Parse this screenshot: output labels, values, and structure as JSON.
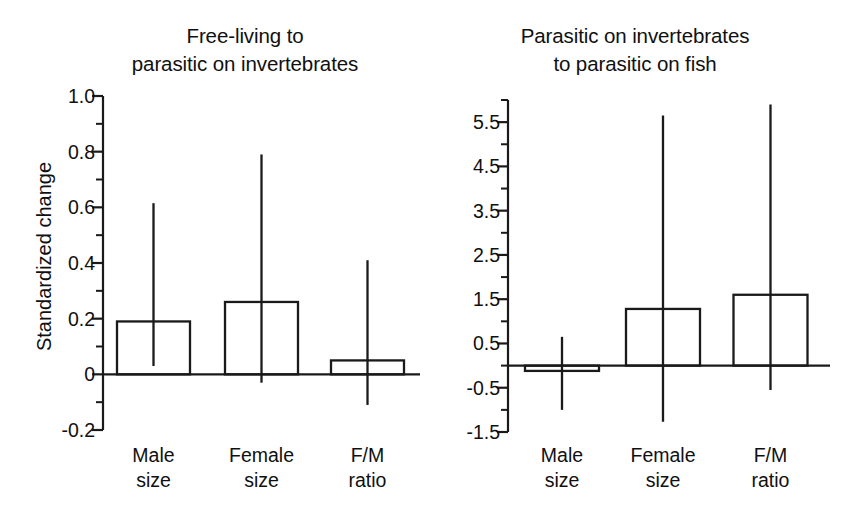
{
  "figure": {
    "ylabel": "Standardized change",
    "background_color": "#ffffff",
    "ink_color": "#1a1a1a"
  },
  "chart_data": [
    {
      "type": "bar",
      "panel": "left",
      "title": "Free-living to\nparasitic on invertebrates",
      "title_lines": [
        "Free-living to",
        "parasitic on invertebrates"
      ],
      "xlabel": "",
      "ylabel": "Standardized change",
      "categories": [
        "Male size",
        "Female size",
        "F/M ratio"
      ],
      "category_lines": [
        [
          "Male",
          "size"
        ],
        [
          "Female",
          "size"
        ],
        [
          "F/M",
          "ratio"
        ]
      ],
      "values": [
        0.19,
        0.26,
        0.05
      ],
      "error_low": [
        0.03,
        -0.03,
        -0.11
      ],
      "error_high": [
        0.615,
        0.79,
        0.41
      ],
      "ylim": [
        -0.2,
        1.0
      ],
      "yticks": [
        1.0,
        0.8,
        0.6,
        0.4,
        0.2,
        0,
        -0.2
      ],
      "ytick_labels": [
        "1.0",
        "0.8",
        "0.6",
        "0.4",
        "0.2",
        "0",
        "-0.2"
      ],
      "yminor_step": 0.1,
      "grid": false,
      "legend": false
    },
    {
      "type": "bar",
      "panel": "right",
      "title": "Parasitic on invertebrates\nto parasitic on fish",
      "title_lines": [
        "Parasitic on invertebrates",
        "to parasitic on fish"
      ],
      "xlabel": "",
      "ylabel": "",
      "categories": [
        "Male size",
        "Female size",
        "F/M ratio"
      ],
      "category_lines": [
        [
          "Male",
          "size"
        ],
        [
          "Female",
          "size"
        ],
        [
          "F/M",
          "ratio"
        ]
      ],
      "values": [
        -0.12,
        1.28,
        1.6
      ],
      "error_low": [
        -1.0,
        -1.27,
        -0.55
      ],
      "error_high": [
        0.65,
        5.65,
        5.9
      ],
      "ylim": [
        -1.5,
        6.0
      ],
      "yticks": [
        5.5,
        4.5,
        3.5,
        2.5,
        1.5,
        0.5,
        -0.5,
        -1.5
      ],
      "ytick_labels": [
        "5.5",
        "4.5",
        "3.5",
        "2.5",
        "1.5",
        "0.5",
        "-0.5",
        "-1.5"
      ],
      "yminor_step": 0.5,
      "grid": false,
      "legend": false
    }
  ]
}
